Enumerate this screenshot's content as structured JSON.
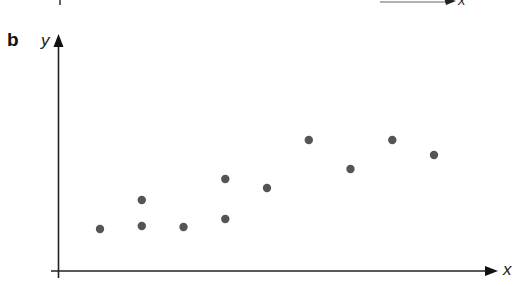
{
  "figure": {
    "panel_label": "b",
    "previous_panel_remnant": {
      "x_axis_label": "x"
    }
  },
  "chart_data": {
    "type": "scatter",
    "title": "",
    "xlabel": "x",
    "ylabel": "y",
    "grid": false,
    "legend": null,
    "ticks": "none (unlabelled axes)",
    "axis_ranges": {
      "x": [
        0,
        10.5
      ],
      "y": [
        0,
        23.5
      ]
    },
    "marker_color": "#555555",
    "points": [
      {
        "x": 1,
        "y": 4.2
      },
      {
        "x": 2,
        "y": 4.5
      },
      {
        "x": 2,
        "y": 7.1
      },
      {
        "x": 3,
        "y": 4.4
      },
      {
        "x": 4,
        "y": 5.2
      },
      {
        "x": 4,
        "y": 9.2
      },
      {
        "x": 5,
        "y": 8.3
      },
      {
        "x": 6,
        "y": 13.1
      },
      {
        "x": 7,
        "y": 10.2
      },
      {
        "x": 8,
        "y": 13.1
      },
      {
        "x": 9,
        "y": 11.6
      }
    ]
  }
}
